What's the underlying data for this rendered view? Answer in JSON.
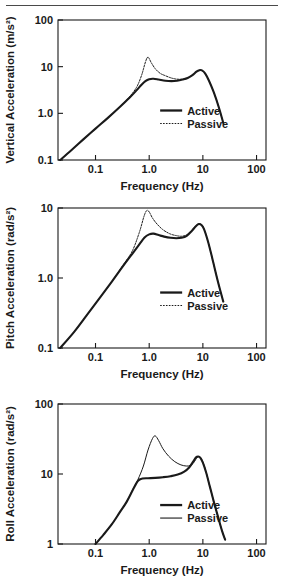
{
  "figure": {
    "has_top_rule": true,
    "axis_color": "#1a1a1a",
    "background": "#ffffff"
  },
  "chart_data": [
    {
      "id": "vertical",
      "type": "line",
      "title": "",
      "xlabel": "Frequency (Hz)",
      "ylabel": "Vertical Acceleration (m/s²)",
      "xscale": "log",
      "yscale": "log",
      "xlim": [
        0.02,
        150
      ],
      "ylim": [
        0.1,
        100
      ],
      "xticks": [
        0.1,
        1.0,
        10,
        100
      ],
      "xticklabels": [
        "0.1",
        "1.0",
        "10",
        "100"
      ],
      "yticks": [
        0.1,
        1.0,
        10,
        100
      ],
      "yticklabels": [
        "0.1",
        "1.0",
        "10",
        "100"
      ],
      "grid": false,
      "legend_position": "lower-right-inside",
      "series": [
        {
          "name": "Active",
          "style": "solid-thick",
          "x": [
            0.022,
            0.035,
            0.06,
            0.1,
            0.17,
            0.28,
            0.42,
            0.58,
            0.72,
            0.85,
            1.0,
            1.2,
            1.5,
            2.0,
            2.6,
            3.3,
            4.2,
            5.2,
            6.4,
            7.6,
            8.6,
            9.6,
            11.0,
            13.0,
            16.0,
            20.0,
            24.0
          ],
          "y": [
            0.1,
            0.16,
            0.28,
            0.47,
            0.8,
            1.35,
            2.1,
            3.1,
            4.1,
            4.9,
            5.4,
            5.5,
            5.3,
            5.0,
            4.9,
            5.0,
            5.3,
            5.7,
            6.6,
            7.8,
            8.4,
            8.3,
            7.2,
            5.0,
            2.8,
            1.3,
            0.62
          ]
        },
        {
          "name": "Passive",
          "style": "dotted-thin",
          "x": [
            0.022,
            0.035,
            0.06,
            0.1,
            0.17,
            0.28,
            0.42,
            0.58,
            0.72,
            0.85,
            0.95,
            1.1,
            1.3,
            1.6,
            2.0,
            2.6,
            3.3,
            4.2,
            5.2,
            6.4,
            7.6,
            8.6,
            9.6,
            11.0,
            13.0,
            16.0,
            20.0,
            24.0
          ],
          "y": [
            0.1,
            0.16,
            0.28,
            0.47,
            0.8,
            1.35,
            2.2,
            3.6,
            6.5,
            12.5,
            16.0,
            12.0,
            9.0,
            7.2,
            6.4,
            5.7,
            5.4,
            5.4,
            5.7,
            6.6,
            7.8,
            8.4,
            8.3,
            7.2,
            5.0,
            2.8,
            1.3,
            0.62
          ]
        }
      ]
    },
    {
      "id": "pitch",
      "type": "line",
      "title": "",
      "xlabel": "Frequency (Hz)",
      "ylabel": "Pitch Acceleration (rad/s²)",
      "xscale": "log",
      "yscale": "log",
      "xlim": [
        0.02,
        150
      ],
      "ylim": [
        0.1,
        10
      ],
      "xticks": [
        0.1,
        1.0,
        10,
        100
      ],
      "xticklabels": [
        "0.1",
        "1.0",
        "10",
        "100"
      ],
      "yticks": [
        0.1,
        1.0,
        10
      ],
      "yticklabels": [
        "0.1",
        "1.0",
        "10"
      ],
      "grid": false,
      "legend_position": "lower-right-inside",
      "series": [
        {
          "name": "Active",
          "style": "solid-thick",
          "x": [
            0.022,
            0.04,
            0.07,
            0.12,
            0.2,
            0.32,
            0.48,
            0.65,
            0.82,
            1.0,
            1.2,
            1.5,
            1.9,
            2.5,
            3.2,
            4.0,
            5.0,
            6.2,
            7.4,
            8.4,
            9.4,
            10.5,
            12.5,
            15.0,
            19.0,
            24.0
          ],
          "y": [
            0.1,
            0.17,
            0.3,
            0.52,
            0.88,
            1.45,
            2.2,
            3.0,
            3.8,
            4.2,
            4.3,
            4.1,
            3.9,
            3.75,
            3.7,
            3.75,
            4.0,
            4.7,
            5.5,
            5.9,
            5.7,
            5.0,
            3.3,
            1.9,
            0.9,
            0.46
          ]
        },
        {
          "name": "Passive",
          "style": "dotted-thin",
          "x": [
            0.022,
            0.04,
            0.07,
            0.12,
            0.2,
            0.32,
            0.48,
            0.65,
            0.8,
            0.9,
            1.0,
            1.15,
            1.4,
            1.8,
            2.4,
            3.1,
            4.0,
            5.0,
            6.2,
            7.4,
            8.4,
            9.4,
            10.5,
            12.5,
            15.0,
            19.0,
            24.0
          ],
          "y": [
            0.1,
            0.17,
            0.3,
            0.52,
            0.88,
            1.5,
            2.4,
            4.4,
            7.6,
            9.2,
            8.8,
            7.2,
            5.9,
            4.9,
            4.3,
            4.05,
            3.95,
            4.15,
            4.8,
            5.6,
            5.95,
            5.75,
            5.0,
            3.3,
            1.9,
            0.9,
            0.46
          ]
        }
      ]
    },
    {
      "id": "roll",
      "type": "line",
      "title": "",
      "xlabel": "Frequency (Hz)",
      "ylabel": "Roll Acceleration (rad/s²)",
      "xscale": "log",
      "yscale": "log",
      "xlim": [
        0.02,
        150
      ],
      "ylim": [
        1,
        100
      ],
      "xticks": [
        0.1,
        1.0,
        10,
        100
      ],
      "xticklabels": [
        "0.1",
        "1.0",
        "10",
        "100"
      ],
      "yticks": [
        1,
        10,
        100
      ],
      "yticklabels": [
        "1",
        "10",
        "100"
      ],
      "grid": false,
      "legend_position": "lower-right-inside",
      "series": [
        {
          "name": "Active",
          "style": "solid-thick",
          "x": [
            0.1,
            0.14,
            0.2,
            0.28,
            0.38,
            0.5,
            0.62,
            0.75,
            0.95,
            1.3,
            1.8,
            2.5,
            3.4,
            4.5,
            5.6,
            6.6,
            7.4,
            8.2,
            9.0,
            10.0,
            11.5,
            13.5,
            16.0,
            19.0,
            23.0,
            26.0
          ],
          "y": [
            1.0,
            1.35,
            1.9,
            2.8,
            4.0,
            6.0,
            8.0,
            8.6,
            8.7,
            8.8,
            9.0,
            9.3,
            9.8,
            10.8,
            12.5,
            15.0,
            17.2,
            17.8,
            17.0,
            14.5,
            10.5,
            6.6,
            4.0,
            2.5,
            1.5,
            1.15
          ]
        },
        {
          "name": "Passive",
          "style": "solid-thin",
          "x": [
            0.1,
            0.14,
            0.2,
            0.28,
            0.38,
            0.5,
            0.62,
            0.78,
            0.95,
            1.15,
            1.3,
            1.5,
            1.8,
            2.3,
            3.0,
            3.9,
            4.9,
            5.8,
            6.6,
            7.4,
            8.2,
            9.0,
            10.0,
            11.5,
            13.5,
            16.0,
            19.0,
            23.0,
            26.0
          ],
          "y": [
            1.0,
            1.35,
            1.9,
            2.8,
            4.0,
            6.1,
            8.4,
            13.0,
            22.0,
            32.0,
            35.0,
            30.0,
            23.0,
            18.0,
            15.0,
            13.5,
            13.0,
            13.2,
            14.2,
            16.2,
            17.6,
            17.2,
            14.8,
            10.6,
            6.6,
            4.0,
            2.5,
            1.5,
            1.15
          ]
        }
      ]
    }
  ],
  "legend": {
    "active_label": "Active",
    "passive_label": "Passive"
  }
}
